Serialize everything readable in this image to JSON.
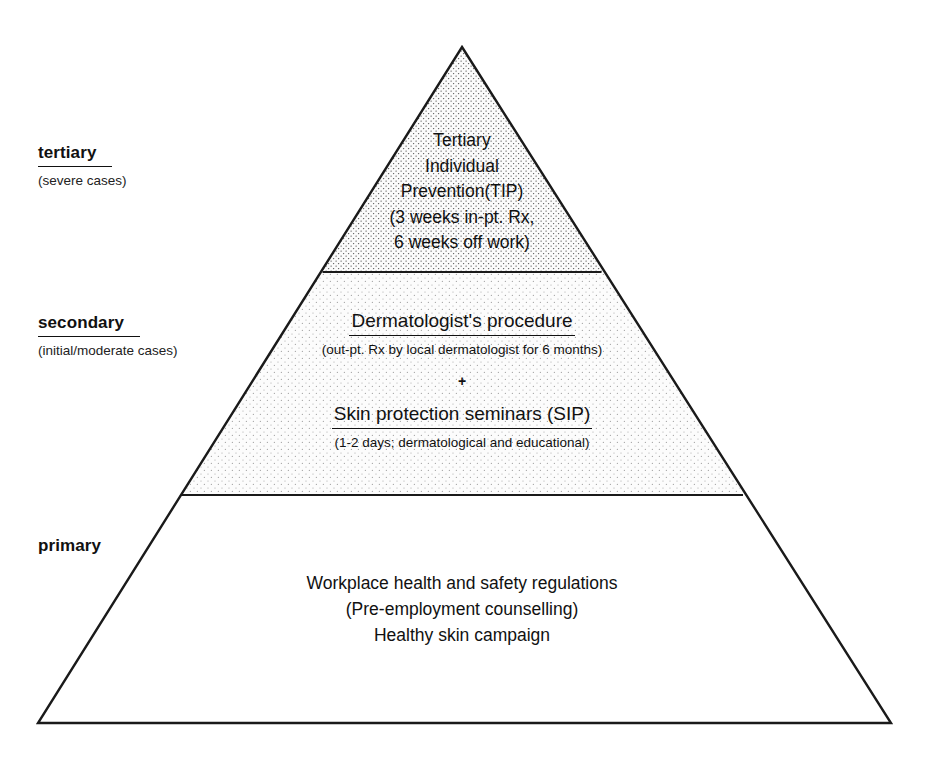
{
  "diagram": {
    "type": "pyramid",
    "background_color": "#ffffff",
    "line_color": "#1a1a1a",
    "geometry": {
      "apex": [
        462,
        47
      ],
      "base_left": [
        38,
        723
      ],
      "base_right": [
        891,
        723
      ],
      "divider_tertiary_secondary_y": 272,
      "divider_secondary_primary_y": 495
    }
  },
  "tiers": [
    {
      "id": "tertiary",
      "label": "tertiary",
      "label_underlined": true,
      "sublabel": "(severe cases)",
      "fill": "dense-dot-stipple",
      "fill_color": "#fbfbfb",
      "dot_color": "#5a5a5a",
      "lines": [
        "Tertiary",
        "Individual",
        "Prevention(TIP)",
        "(3 weeks in-pt. Rx,",
        "6 weeks off work)"
      ]
    },
    {
      "id": "secondary",
      "label": "secondary",
      "label_underlined": true,
      "sublabel": "(initial/moderate cases)",
      "fill": "light-dot-stipple",
      "fill_color": "#fcfcfc",
      "dot_color": "#9a9a9a",
      "blocks": [
        {
          "heading": "Dermatologist's procedure",
          "heading_underlined": true,
          "subtext": "(out-pt. Rx by local dermatologist for 6 months)"
        },
        {
          "heading": "Skin protection seminars (SIP)",
          "heading_underlined": true,
          "subtext": "(1-2 days; dermatological and educational)"
        }
      ],
      "separator": "+"
    },
    {
      "id": "primary",
      "label": "primary",
      "label_underlined": false,
      "sublabel": "",
      "fill": "none",
      "fill_color": "#ffffff",
      "lines": [
        "Workplace health and safety regulations",
        "(Pre-employment counselling)",
        "Healthy skin campaign"
      ]
    }
  ]
}
